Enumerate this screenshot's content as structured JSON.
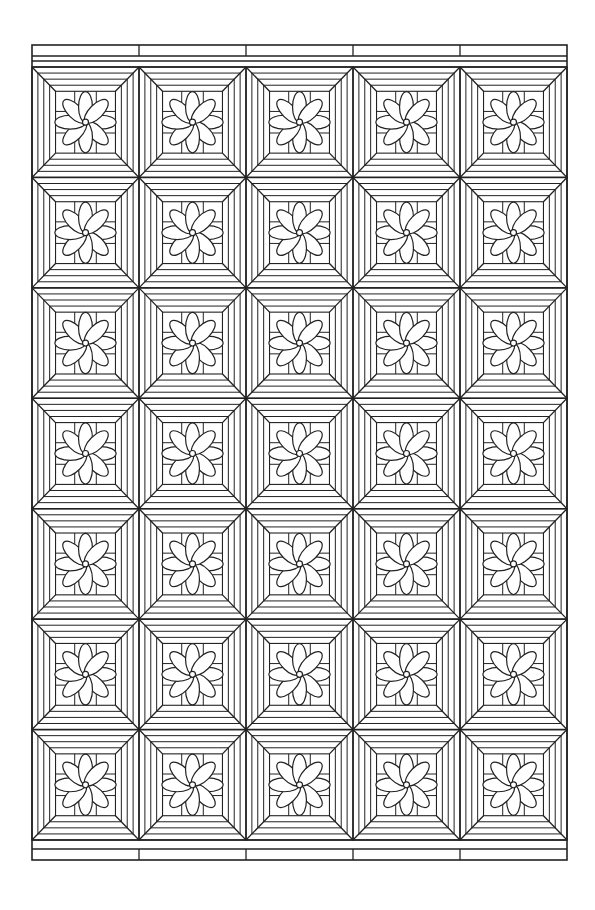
{
  "page": {
    "background": "#ffffff",
    "stroke": "#222222"
  },
  "pattern": {
    "frame": {
      "x": 32,
      "y": 45,
      "width": 535,
      "height": 815
    },
    "grid": {
      "cols": 5,
      "rows": 7,
      "top": 67,
      "bottom": 840
    },
    "tile_motif": "eight-petal-flower-with-diagonal-parquet-bands",
    "border_bands": {
      "top": 2,
      "bottom": 2
    }
  }
}
